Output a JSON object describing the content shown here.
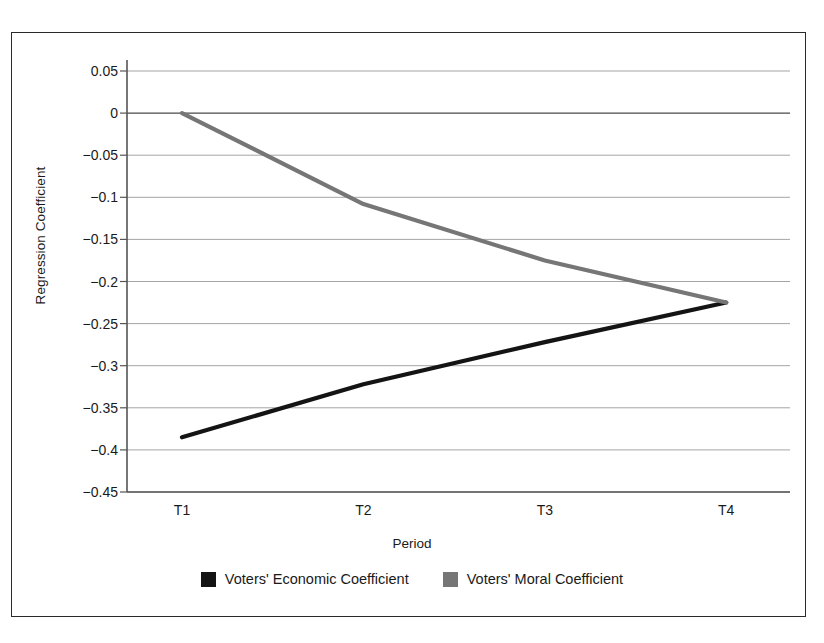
{
  "chart_data": {
    "type": "line",
    "title": "",
    "xlabel": "Period",
    "ylabel": "Regression Coefficient",
    "categories": [
      "T1",
      "T2",
      "T3",
      "T4"
    ],
    "ylim": [
      -0.45,
      0.05
    ],
    "ytick_labels": [
      "0.05",
      "0",
      "−0.05",
      "−0.1",
      "−0.15",
      "−0.2",
      "−0.25",
      "−0.3",
      "−0.35",
      "−0.4",
      "−0.45"
    ],
    "ytick_values": [
      0.05,
      0,
      -0.05,
      -0.1,
      -0.15,
      -0.2,
      -0.25,
      -0.3,
      -0.35,
      -0.4,
      -0.45
    ],
    "grid": true,
    "legend_position": "bottom",
    "series": [
      {
        "name": "Voters' Economic Coefficient",
        "color": "#141414",
        "values": [
          -0.385,
          -0.322,
          -0.272,
          -0.225
        ]
      },
      {
        "name": "Voters' Moral Coefficient",
        "color": "#767676",
        "values": [
          0.0,
          -0.108,
          -0.175,
          -0.225
        ]
      }
    ]
  },
  "colors": {
    "frame": "#2a2a2a",
    "axis": "#555555",
    "gridline": "#9a9a9a",
    "economic": "#141414",
    "moral": "#767676",
    "background": "#ffffff"
  }
}
